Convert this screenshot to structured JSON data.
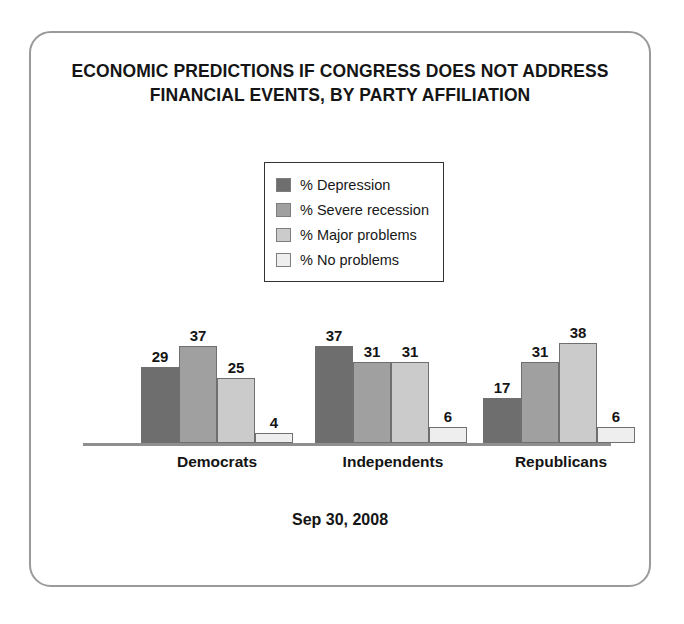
{
  "chart_data": {
    "type": "bar",
    "title": "ECONOMIC PREDICTIONS IF CONGRESS DOES NOT ADDRESS FINANCIAL EVENTS, BY PARTY AFFILIATION",
    "title_lines": [
      "ECONOMIC PREDICTIONS IF CONGRESS DOES NOT ADDRESS",
      "FINANCIAL EVENTS, BY PARTY AFFILIATION"
    ],
    "categories": [
      "Democrats",
      "Independents",
      "Republicans"
    ],
    "series": [
      {
        "name": "% Depression",
        "values": [
          29,
          37,
          17
        ],
        "color": "#6e6e6e"
      },
      {
        "name": "% Severe recession",
        "values": [
          37,
          31,
          31
        ],
        "color": "#a0a0a0"
      },
      {
        "name": "% Major problems",
        "values": [
          25,
          31,
          38
        ],
        "color": "#cbcbcb"
      },
      {
        "name": "% No problems",
        "values": [
          4,
          6,
          6
        ],
        "color": "#eeeeee"
      }
    ],
    "xlabel": "",
    "ylabel": "",
    "ylim": [
      0,
      42
    ],
    "grid": false,
    "axis_visible": "x-baseline-only",
    "legend_position": "top-center",
    "footnote": "Sep 30, 2008",
    "data_labels": true
  },
  "legend": {
    "items": [
      {
        "label": "% Depression",
        "swatch": "#6e6e6e"
      },
      {
        "label": "% Severe recession",
        "swatch": "#a0a0a0"
      },
      {
        "label": "% Major problems",
        "swatch": "#cbcbcb"
      },
      {
        "label": "% No problems",
        "swatch": "#eeeeee"
      }
    ]
  },
  "footer": {
    "date": "Sep 30, 2008"
  },
  "frame": {
    "border_color": "#9a9a9a"
  }
}
